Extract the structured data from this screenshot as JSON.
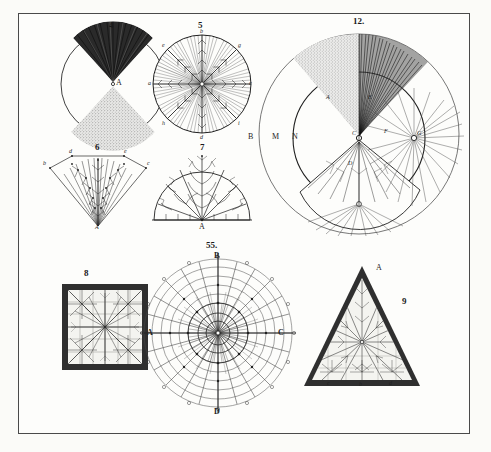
{
  "plate": {
    "title": "Engraved plate of crystallization / frost figures",
    "paper_color": "#fdfdfb",
    "ink_color": "#1f1f1f",
    "border_color": "#4a4a4a"
  },
  "figures": [
    {
      "id": "fig4",
      "number": "4",
      "shape": "circle",
      "description": "Circle with dark hatched upper wedge and stippled lower wedge meeting at centre point A",
      "labels": [
        {
          "text": "A",
          "role": "centre-point"
        }
      ]
    },
    {
      "id": "fig5",
      "number": "5",
      "shape": "circle",
      "description": "Circle divided by eight radii into hatched sectors, each radius bearing feathered barbs; lettered points around circumference",
      "labels": [
        {
          "text": "a",
          "role": "left-axis"
        },
        {
          "text": "b",
          "role": "top-axis"
        },
        {
          "text": "c",
          "role": "right-axis"
        },
        {
          "text": "d",
          "role": "bottom-axis"
        },
        {
          "text": "e",
          "role": "upper-left-diagonal"
        },
        {
          "text": "g",
          "role": "upper-right-diagonal"
        },
        {
          "text": "h",
          "role": "lower-left-diagonal"
        },
        {
          "text": "i",
          "role": "lower-right-diagonal"
        }
      ]
    },
    {
      "id": "fig12",
      "number": "12.",
      "shape": "double-circle",
      "description": "Large outer circle with inner circle; stippled upper-left wedge, dark hatched upper-right wedge, feathered lower wedge, and a radiating burst node at right",
      "labels": [
        {
          "text": "B",
          "role": "outer-left"
        },
        {
          "text": "M",
          "role": "mid-left"
        },
        {
          "text": "N",
          "role": "inner-left"
        },
        {
          "text": "C",
          "role": "centre"
        },
        {
          "text": "D",
          "role": "lower-wedge"
        },
        {
          "text": "A",
          "role": "upper-left-wedge"
        },
        {
          "text": "E",
          "role": "upper-right-wedge"
        },
        {
          "text": "F",
          "role": "right-node"
        },
        {
          "text": "G",
          "role": "burst-centre"
        }
      ]
    },
    {
      "id": "fig6",
      "number": "6",
      "shape": "wedge",
      "description": "Open fan/wedge outline filled with a dense plume of branching feathered stems rising from apex A",
      "labels": [
        {
          "text": "A",
          "role": "apex"
        },
        {
          "text": "b",
          "role": "left-corner"
        },
        {
          "text": "c",
          "role": "right-corner"
        },
        {
          "text": "d",
          "role": "top-left"
        },
        {
          "text": "e",
          "role": "top-right"
        }
      ]
    },
    {
      "id": "fig7",
      "number": "7",
      "shape": "semicircle",
      "description": "Semicircle on a baseline filled with branching fern-like rays springing from base point A",
      "labels": [
        {
          "text": "A",
          "role": "base-centre"
        },
        {
          "text": "b",
          "role": "left-base"
        },
        {
          "text": "c",
          "role": "right-base"
        },
        {
          "text": "d",
          "role": "arc-left"
        },
        {
          "text": "e",
          "role": "arc-right"
        }
      ]
    },
    {
      "id": "fig8",
      "number": "8",
      "shape": "square",
      "description": "Heavy dark-bordered square enclosing a ruled grid overlaid with radiating star-shaped frost figures",
      "labels": []
    },
    {
      "id": "fig55",
      "number": "55.",
      "shape": "polar-diagram",
      "description": "Concentric-circle polar diagram with radial spokes, dense central rosette of fine rays, and lettered points on the circumference",
      "labels": [
        {
          "text": "B",
          "role": "top"
        },
        {
          "text": "C",
          "role": "right"
        },
        {
          "text": "D",
          "role": "bottom"
        },
        {
          "text": "A",
          "role": "left"
        },
        {
          "text": "o",
          "role": "circumference-mark"
        }
      ]
    },
    {
      "id": "fig9",
      "number": "9",
      "shape": "triangle",
      "description": "Dark-bordered equilateral triangle enclosing a radiating fern-frost figure; apex lettered A with lowercase marks along the base",
      "labels": [
        {
          "text": "A",
          "role": "apex"
        },
        {
          "text": "c",
          "role": "base-left"
        },
        {
          "text": "b",
          "role": "base-centre"
        },
        {
          "text": "d",
          "role": "base-right"
        }
      ]
    }
  ]
}
